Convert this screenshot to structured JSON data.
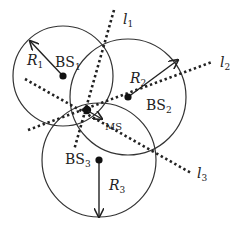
{
  "diagram": {
    "type": "trilateration",
    "base_stations": [
      {
        "id": "BS1",
        "label": "BS",
        "sub": "1",
        "radius_label": "R",
        "radius_sub": "1",
        "cx": 63,
        "cy": 76,
        "r": 50,
        "arrow_to": [
          30,
          41
        ]
      },
      {
        "id": "BS2",
        "label": "BS",
        "sub": "2",
        "radius_label": "R",
        "radius_sub": "2",
        "cx": 128,
        "cy": 97,
        "r": 58,
        "arrow_to": [
          178,
          60
        ]
      },
      {
        "id": "BS3",
        "label": "BS",
        "sub": "3",
        "radius_label": "R",
        "radius_sub": "3",
        "cx": 99,
        "cy": 160,
        "r": 57,
        "arrow_to": [
          99,
          217
        ]
      }
    ],
    "lines": [
      {
        "id": "l1",
        "label": "l",
        "sub": "1"
      },
      {
        "id": "l2",
        "label": "l",
        "sub": "2"
      },
      {
        "id": "l3",
        "label": "l",
        "sub": "3"
      }
    ],
    "mobile_station": {
      "label": "MS"
    },
    "colors": {
      "stroke": "#333333",
      "background": "#ffffff"
    }
  }
}
